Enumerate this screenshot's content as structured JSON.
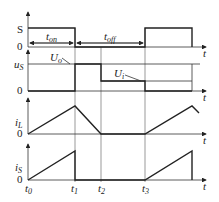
{
  "diagram": {
    "title": "",
    "panels": [
      {
        "id": "S",
        "label": "S",
        "zero": "0",
        "axis_t": "t"
      },
      {
        "id": "uS",
        "label": "u",
        "label_sub": "S",
        "zero": "0",
        "axis_t": "t",
        "annotations": [
          {
            "text": "U",
            "sub": "o"
          },
          {
            "text": "U",
            "sub": "i"
          }
        ]
      },
      {
        "id": "iL",
        "label": "i",
        "label_sub": "L",
        "zero": "0",
        "axis_t": "t"
      },
      {
        "id": "iS",
        "label": "i",
        "label_sub": "S",
        "zero": "0",
        "axis_t": "t"
      }
    ],
    "intervals": {
      "t_on": {
        "text": "t",
        "sub": "on"
      },
      "t_off": {
        "text": "t",
        "sub": "off"
      }
    },
    "time_ticks": [
      {
        "text": "t",
        "sub": "0"
      },
      {
        "text": "t",
        "sub": "1"
      },
      {
        "text": "t",
        "sub": "2"
      },
      {
        "text": "t",
        "sub": "3"
      }
    ]
  }
}
